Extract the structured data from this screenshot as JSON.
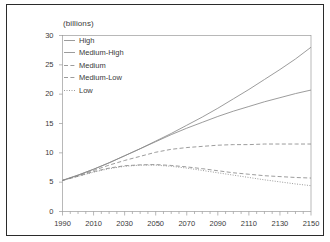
{
  "chart_data": {
    "type": "line",
    "title": "",
    "subtitle": "",
    "unit_label": "(billions)",
    "xlabel": "",
    "ylabel": "",
    "xlim": [
      1990,
      2150
    ],
    "ylim": [
      0,
      30
    ],
    "xticks": [
      1990,
      2010,
      2030,
      2050,
      2070,
      2090,
      2110,
      2130,
      2150
    ],
    "yticks": [
      0,
      5,
      10,
      15,
      20,
      25,
      30
    ],
    "x_minor_tick_step": 5,
    "grid": false,
    "legend_position": "top-left",
    "x": [
      1990,
      2000,
      2010,
      2020,
      2030,
      2040,
      2050,
      2060,
      2070,
      2080,
      2090,
      2100,
      2110,
      2120,
      2130,
      2140,
      2150
    ],
    "series": [
      {
        "name": "High",
        "style": "solid",
        "color": "#8a8a8a",
        "values": [
          5.3,
          6.2,
          7.2,
          8.3,
          9.5,
          10.7,
          12.0,
          13.3,
          14.7,
          16.1,
          17.6,
          19.2,
          20.8,
          22.5,
          24.2,
          26.0,
          28.0
        ]
      },
      {
        "name": "Medium-High",
        "style": "solid",
        "color": "#8a8a8a",
        "values": [
          5.3,
          6.2,
          7.2,
          8.3,
          9.5,
          10.7,
          11.9,
          13.1,
          14.2,
          15.2,
          16.2,
          17.1,
          17.9,
          18.7,
          19.4,
          20.1,
          20.7
        ]
      },
      {
        "name": "Medium",
        "style": "dashed",
        "color": "#8a8a8a",
        "values": [
          5.3,
          6.1,
          7.0,
          7.9,
          8.7,
          9.4,
          10.1,
          10.6,
          10.9,
          11.1,
          11.3,
          11.4,
          11.4,
          11.5,
          11.5,
          11.5,
          11.5
        ]
      },
      {
        "name": "Medium-Low",
        "style": "dashed",
        "color": "#8a8a8a",
        "values": [
          5.3,
          6.0,
          6.8,
          7.4,
          7.8,
          7.95,
          8.0,
          7.85,
          7.6,
          7.3,
          6.95,
          6.6,
          6.35,
          6.1,
          5.95,
          5.8,
          5.7
        ]
      },
      {
        "name": "Low",
        "style": "dotted",
        "color": "#8a8a8a",
        "values": [
          5.3,
          6.0,
          6.7,
          7.3,
          7.7,
          7.9,
          7.9,
          7.7,
          7.4,
          7.0,
          6.6,
          6.2,
          5.8,
          5.4,
          5.05,
          4.7,
          4.4
        ]
      }
    ]
  },
  "axes": {
    "y_tick_labels": [
      "0",
      "5",
      "10",
      "15",
      "20",
      "25",
      "30"
    ],
    "x_tick_labels": [
      "1990",
      "2010",
      "2030",
      "2050",
      "2070",
      "2090",
      "2110",
      "2130",
      "2150"
    ]
  },
  "legend": {
    "items": [
      {
        "label": "High",
        "style": "solid"
      },
      {
        "label": "Medium-High",
        "style": "solid"
      },
      {
        "label": "Medium",
        "style": "dashed"
      },
      {
        "label": "Medium-Low",
        "style": "dashed"
      },
      {
        "label": "Low",
        "style": "dotted"
      }
    ]
  },
  "colors": {
    "line": "#8a8a8a",
    "axis": "#9a9a9a",
    "text": "#3a3a3a",
    "frame": "#2b2b2b",
    "background": "#ffffff"
  }
}
